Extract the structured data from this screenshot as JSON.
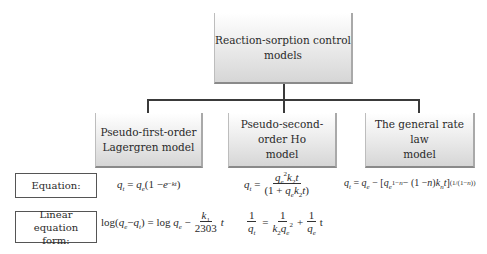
{
  "diagram": {
    "root": {
      "label_line1": "Reaction-sorption control",
      "label_line2": "models"
    },
    "children": [
      {
        "label_line1": "Pseudo-first-order",
        "label_line2": "Lagergren model"
      },
      {
        "label_line1": "Pseudo-second-order Ho",
        "label_line2": "model"
      },
      {
        "label_line1": "The general rate law",
        "label_line2": "model"
      }
    ],
    "row_labels": {
      "equation": "Equation:",
      "linear_line1": "Linear equation",
      "linear_line2": "form:"
    },
    "equations": {
      "pfo": "q_t = q_e(1 − e^(−kt))",
      "pso": "q_t = q_e^2 k_2 t / (1 + q_e k_2 t)",
      "general": "q_t = q_e − [q_e^(1−n) − (1−n) k_n t]^(1/(1−n))"
    },
    "linear_forms": {
      "pfo": "log(q_e − q_t) = log q_e − (k_1 / 2303) t",
      "pso": "1/q_t = 1/(k_2 q_e^2) + (1/q_e) t"
    },
    "text": {
      "eq_equals": "=",
      "minus": "−",
      "plus": "+",
      "k1": "1",
      "n2303": "2303",
      "one": "1"
    }
  }
}
